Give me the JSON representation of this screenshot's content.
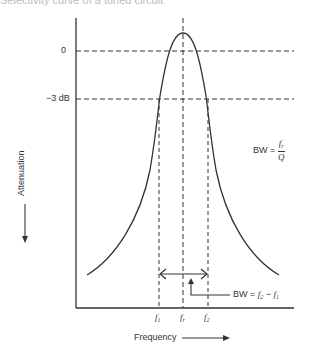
{
  "caption": "Selectivity curve of a tuned circuit",
  "y_axis": {
    "label": "Attenuation",
    "ticks": [
      "0",
      "−3 dB"
    ]
  },
  "x_axis": {
    "label": "Frequency",
    "ticks": [
      {
        "base": "f",
        "sub": "1"
      },
      {
        "base": "f",
        "sub": "r"
      },
      {
        "base": "f",
        "sub": "2"
      }
    ]
  },
  "annotations": {
    "bw_ratio": {
      "prefix": "BW = ",
      "num_base": "f",
      "num_sub": "r",
      "den": "Q"
    },
    "bw_diff": {
      "prefix": "BW = ",
      "a_base": "f",
      "a_sub": "2",
      "minus": " − ",
      "b_base": "f",
      "b_sub": "1"
    }
  },
  "colors": {
    "line": "#333333",
    "background": "#ffffff"
  }
}
